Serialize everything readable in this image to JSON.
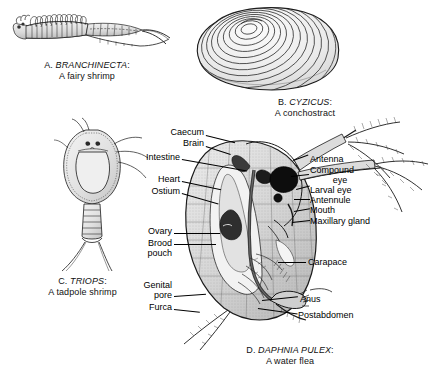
{
  "plate": {
    "title": "Branchiopod crustaceans comparative plate",
    "background": "#ffffff",
    "ink": "#000000"
  },
  "figures": [
    {
      "key": "A",
      "letter": "A.",
      "genus": "BRANCHINECTA",
      "common": "A fairy shrimp",
      "caption_line1": "A. BRANCHINECTA:",
      "caption_line2": "A fairy shrimp"
    },
    {
      "key": "B",
      "letter": "B.",
      "genus": "CYZICUS",
      "common": "A conchostract",
      "caption_line1": "B. CYZICUS:",
      "caption_line2": "A conchostract"
    },
    {
      "key": "C",
      "letter": "C.",
      "genus": "TRIOPS",
      "common": "A tadpole shrimp",
      "caption_line1": "C. TRIOPS:",
      "caption_line2": "A tadpole shrimp"
    },
    {
      "key": "D",
      "letter": "D.",
      "genus": "DAPHNIA PULEX",
      "common": "A water flea",
      "caption_line1": "D. DAPHNIA PULEX:",
      "caption_line2": "A water flea"
    }
  ],
  "anatomy_labels": {
    "left": [
      {
        "text": "Caecum"
      },
      {
        "text": "Brain"
      },
      {
        "text": "Intestine"
      },
      {
        "text": "Heart"
      },
      {
        "text": "Ostium"
      },
      {
        "text": "Ovary"
      },
      {
        "text": "Brood",
        "text2": "pouch"
      },
      {
        "text": "Genital",
        "text2": "pore"
      },
      {
        "text": "Furca"
      }
    ],
    "right": [
      {
        "text": "Antenna"
      },
      {
        "text": "Compound",
        "text2": "eye"
      },
      {
        "text": "Larval eye"
      },
      {
        "text": "Antennule"
      },
      {
        "text": "Mouth"
      },
      {
        "text": "Maxillary gland"
      },
      {
        "text": "Carapace"
      },
      {
        "text": "Anus"
      },
      {
        "text": "Postabdomen"
      }
    ]
  }
}
